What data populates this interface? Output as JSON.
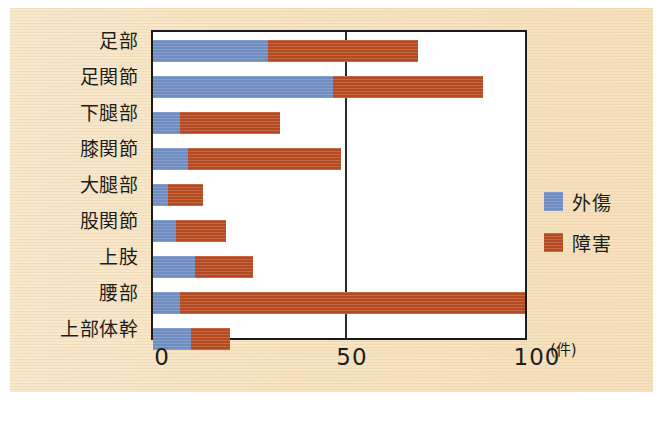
{
  "chart_data": {
    "type": "bar",
    "orientation": "horizontal",
    "stacked": true,
    "title": "",
    "xlabel": "(件)",
    "ylabel": "",
    "xlim": [
      0,
      100
    ],
    "xticks": [
      0,
      50,
      100
    ],
    "xtick_labels": [
      "0",
      "50",
      "100"
    ],
    "grid": "vertical-at-50",
    "legend_position": "right",
    "categories": [
      "足部",
      "足関節",
      "下腿部",
      "膝関節",
      "大腿部",
      "股関節",
      "上肢",
      "腰部",
      "上部体幹"
    ],
    "series": [
      {
        "name": "外傷",
        "color": "#6f8dc0",
        "values": [
          30,
          47,
          7,
          9,
          4,
          6,
          11,
          7,
          10
        ]
      },
      {
        "name": "障害",
        "color": "#b5491f",
        "values": [
          39,
          39,
          26,
          40,
          9,
          13,
          15,
          90,
          10
        ]
      }
    ],
    "totals": [
      69,
      86,
      33,
      49,
      13,
      19,
      26,
      97,
      20
    ]
  },
  "axis": {
    "unit_label": "(件)",
    "tick_labels": [
      "0",
      "50",
      "100"
    ]
  },
  "legend": {
    "items": [
      {
        "label": "外傷",
        "color": "#6f8dc0"
      },
      {
        "label": "障害",
        "color": "#b5491f"
      }
    ]
  },
  "caption": {
    "text": ""
  },
  "colors": {
    "paper": "#f7e4c4",
    "plot_background": "#ffffff",
    "frame": "#1b1b1b",
    "series_blue": "#6f8dc0",
    "series_red": "#b5491f",
    "text": "#1d1d1b"
  }
}
